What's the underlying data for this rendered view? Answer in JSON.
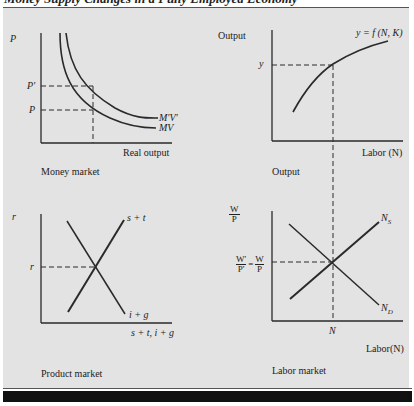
{
  "header": {
    "text": "Money Supply Changes in a Fully Employed Economy"
  },
  "colors": {
    "panel": "#e3e3e3",
    "ink": "#2a2a2a",
    "bar": "#111111"
  },
  "money_market": {
    "caption": "Money market",
    "y_axis_label": "P",
    "x_axis_label": "Real output",
    "ticks": {
      "p_prime": "P'",
      "p": "P"
    },
    "curves": {
      "mv": "MV",
      "mv_prime": "M'V'"
    }
  },
  "output": {
    "caption": "Output",
    "y_axis_label": "Output",
    "x_axis_label": "Labor (N)",
    "ticks": {
      "y": "y"
    },
    "curve_label": "y = f (N, K)"
  },
  "product_market": {
    "caption": "Product market",
    "y_axis_label": "r",
    "x_axis_label": "s + t, i + g",
    "ticks": {
      "r": "r"
    },
    "curves": {
      "savings_taxes": "s + t",
      "investment_gov": "i + g"
    }
  },
  "labor_market": {
    "caption": "Labor market",
    "y_axis_label_num": "W",
    "y_axis_label_den": "P",
    "x_axis_label": "Labor(N)",
    "ticks": {
      "eq_num_left": "W'",
      "eq_den_left": "P'",
      "eq_sign": "=",
      "eq_num_right": "W",
      "eq_den_right": "P",
      "n": "N"
    },
    "curves": {
      "supply": "N",
      "supply_sub": "S",
      "demand": "N",
      "demand_sub": "D"
    }
  }
}
